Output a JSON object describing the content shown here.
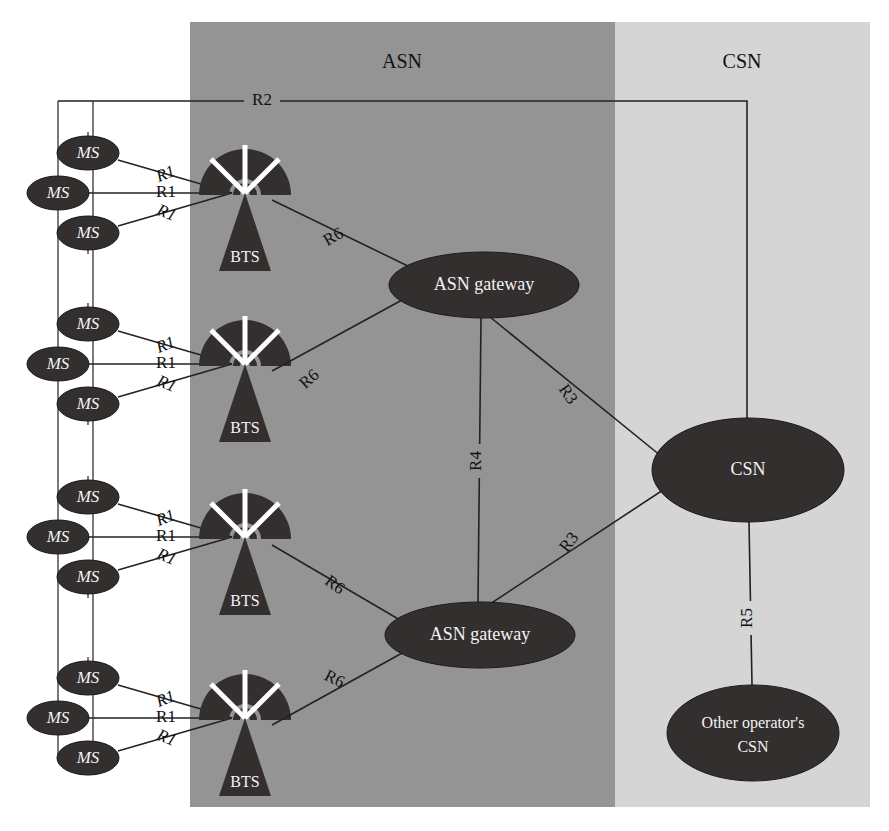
{
  "diagram": {
    "type": "network-architecture"
  },
  "zones": [
    {
      "id": "asn",
      "label": "ASN",
      "color": "#949494",
      "x": 190,
      "y": 22,
      "width": 425,
      "height": 785,
      "label_x": 402,
      "label_y": 68
    },
    {
      "id": "csn",
      "label": "CSN",
      "color": "#d5d5d5",
      "x": 615,
      "y": 22,
      "width": 255,
      "height": 785,
      "label_x": 742,
      "label_y": 68
    }
  ],
  "bus_lines": [
    {
      "name": "outer-bus",
      "x": 58,
      "y1": 101,
      "y2": 760
    },
    {
      "name": "inner-bus",
      "x": 93,
      "y1": 101,
      "y2": 760
    }
  ],
  "ms_groups": [
    {
      "group": 1,
      "stations": [
        {
          "label": "MS",
          "cx": 88,
          "cy": 153
        },
        {
          "label": "MS",
          "cx": 58,
          "cy": 193
        },
        {
          "label": "MS",
          "cx": 88,
          "cy": 233
        }
      ],
      "bts": {
        "label": "BTS",
        "cx": 245,
        "cy": 185
      },
      "hub": {
        "x": 232,
        "y": 193
      },
      "r1_labels": [
        {
          "text": "R1",
          "x": 166,
          "y": 175,
          "rot": -22
        },
        {
          "text": "R1",
          "x": 166,
          "y": 193,
          "rot": 0
        },
        {
          "text": "R1",
          "x": 166,
          "y": 214,
          "rot": 22
        }
      ]
    },
    {
      "group": 2,
      "stations": [
        {
          "label": "MS",
          "cx": 88,
          "cy": 324
        },
        {
          "label": "MS",
          "cx": 58,
          "cy": 364
        },
        {
          "label": "MS",
          "cx": 88,
          "cy": 404
        }
      ],
      "bts": {
        "label": "BTS",
        "cx": 245,
        "cy": 356
      },
      "hub": {
        "x": 232,
        "y": 364
      },
      "r1_labels": [
        {
          "text": "R1",
          "x": 166,
          "y": 346,
          "rot": -22
        },
        {
          "text": "R1",
          "x": 166,
          "y": 364,
          "rot": 0
        },
        {
          "text": "R1",
          "x": 166,
          "y": 385,
          "rot": 22
        }
      ]
    },
    {
      "group": 3,
      "stations": [
        {
          "label": "MS",
          "cx": 88,
          "cy": 497
        },
        {
          "label": "MS",
          "cx": 58,
          "cy": 537
        },
        {
          "label": "MS",
          "cx": 88,
          "cy": 577
        }
      ],
      "bts": {
        "label": "BTS",
        "cx": 245,
        "cy": 529
      },
      "hub": {
        "x": 232,
        "y": 537
      },
      "r1_labels": [
        {
          "text": "R1",
          "x": 166,
          "y": 519,
          "rot": -22
        },
        {
          "text": "R1",
          "x": 166,
          "y": 537,
          "rot": 0
        },
        {
          "text": "R1",
          "x": 166,
          "y": 558,
          "rot": 22
        }
      ]
    },
    {
      "group": 4,
      "stations": [
        {
          "label": "MS",
          "cx": 88,
          "cy": 678
        },
        {
          "label": "MS",
          "cx": 58,
          "cy": 718
        },
        {
          "label": "MS",
          "cx": 88,
          "cy": 758
        }
      ],
      "bts": {
        "label": "BTS",
        "cx": 245,
        "cy": 710
      },
      "hub": {
        "x": 232,
        "y": 718
      },
      "r1_labels": [
        {
          "text": "R1",
          "x": 166,
          "y": 700,
          "rot": -22
        },
        {
          "text": "R1",
          "x": 166,
          "y": 718,
          "rot": 0
        },
        {
          "text": "R1",
          "x": 166,
          "y": 739,
          "rot": 22
        }
      ]
    }
  ],
  "core_nodes": [
    {
      "id": "asn-gw-1",
      "label": "ASN gateway",
      "cx": 484,
      "cy": 285,
      "rx": 95,
      "ry": 33
    },
    {
      "id": "asn-gw-2",
      "label": "ASN gateway",
      "cx": 480,
      "cy": 635,
      "rx": 95,
      "ry": 33
    },
    {
      "id": "csn",
      "label": "CSN",
      "cx": 748,
      "cy": 470,
      "rx": 96,
      "ry": 52
    },
    {
      "id": "other-csn",
      "label_line1": "Other operator's",
      "label_line2": "CSN",
      "cx": 753,
      "cy": 733,
      "rx": 86,
      "ry": 48
    }
  ],
  "interfaces": [
    {
      "name": "R2",
      "text": "R2",
      "x": 262,
      "y": 101,
      "rot": 0
    },
    {
      "name": "R6-1",
      "text": "R6",
      "x": 334,
      "y": 238,
      "rot": -30
    },
    {
      "name": "R6-2",
      "text": "R6",
      "x": 310,
      "y": 380,
      "rot": -42
    },
    {
      "name": "R6-3",
      "text": "R6",
      "x": 334,
      "y": 586,
      "rot": 36
    },
    {
      "name": "R6-4",
      "text": "R6",
      "x": 334,
      "y": 680,
      "rot": 26
    },
    {
      "name": "R3-upper",
      "text": "R3",
      "x": 567,
      "y": 395,
      "rot": 56
    },
    {
      "name": "R3-lower",
      "text": "R3",
      "x": 570,
      "y": 543,
      "rot": -52
    },
    {
      "name": "R4",
      "text": "R4",
      "x": 477,
      "y": 460,
      "rot": -90
    },
    {
      "name": "R5",
      "text": "R5",
      "x": 748,
      "y": 617,
      "rot": -90
    }
  ],
  "edges": [
    {
      "name": "r2-trunk",
      "from": "ms-bus",
      "to": "csn"
    },
    {
      "name": "r6-bts1-gw1",
      "from": "bts-1",
      "to": "asn-gw-1"
    },
    {
      "name": "r6-bts2-gw1",
      "from": "bts-2",
      "to": "asn-gw-1"
    },
    {
      "name": "r6-bts3-gw2",
      "from": "bts-3",
      "to": "asn-gw-2"
    },
    {
      "name": "r6-bts4-gw2",
      "from": "bts-4",
      "to": "asn-gw-2"
    },
    {
      "name": "r4-gw1-gw2",
      "from": "asn-gw-1",
      "to": "asn-gw-2"
    },
    {
      "name": "r3-gw1-csn",
      "from": "asn-gw-1",
      "to": "csn"
    },
    {
      "name": "r3-gw2-csn",
      "from": "asn-gw-2",
      "to": "csn"
    },
    {
      "name": "r5-csn-other",
      "from": "csn",
      "to": "other-csn"
    }
  ],
  "colors": {
    "asn_zone": "#949494",
    "csn_zone": "#d5d5d5",
    "node_fill": "#332f2f",
    "node_text": "#f2f2f2",
    "line": "#222222",
    "page_bg": "#ffffff"
  }
}
